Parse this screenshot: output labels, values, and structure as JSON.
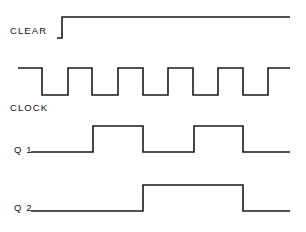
{
  "diagram": {
    "type": "timing-waveform",
    "width": 306,
    "height": 232,
    "background_color": "#ffffff",
    "stroke_color": "#1a1a1a"
  },
  "signals": [
    {
      "key": "clear",
      "label": "CLEAR",
      "label_x": 10,
      "label_y": 31,
      "high_y": 17,
      "low_y": 38,
      "start_x": 57,
      "end_x": 290,
      "description": "Active low then released high",
      "transitions": [
        {
          "x": 62,
          "edge": "rise"
        }
      ],
      "initial_level": "low",
      "path": "M 57 38 L 62 38 L 62 17 L 290 17"
    },
    {
      "key": "clock",
      "label": "CLOCK",
      "label_x": 10,
      "label_y": 108,
      "high_y": 68,
      "low_y": 95,
      "start_x": 18,
      "end_x": 290,
      "description": "Free running square wave, period 50 px",
      "initial_level": "high",
      "transitions": [
        {
          "x": 42,
          "edge": "fall"
        },
        {
          "x": 68,
          "edge": "rise"
        },
        {
          "x": 92,
          "edge": "fall"
        },
        {
          "x": 118,
          "edge": "rise"
        },
        {
          "x": 143,
          "edge": "fall"
        },
        {
          "x": 168,
          "edge": "rise"
        },
        {
          "x": 193,
          "edge": "fall"
        },
        {
          "x": 218,
          "edge": "rise"
        },
        {
          "x": 243,
          "edge": "fall"
        },
        {
          "x": 268,
          "edge": "rise"
        }
      ],
      "path": "M 18 68 L 42 68 L 42 95 L 68 95 L 68 68 L 92 68 L 92 95 L 118 95 L 118 68 L 143 68 L 143 95 L 168 95 L 168 68 L 193 68 L 193 95 L 218 95 L 218 68 L 243 68 L 243 95 L 268 95 L 268 68 L 290 68"
    },
    {
      "key": "q1",
      "label": "Q 1",
      "label_x": 14,
      "label_y": 150,
      "high_y": 126,
      "low_y": 152,
      "start_x": 31,
      "end_x": 290,
      "description": "Divide by two output, two pulses shown",
      "initial_level": "low",
      "transitions": [
        {
          "x": 93,
          "edge": "rise"
        },
        {
          "x": 143,
          "edge": "fall"
        },
        {
          "x": 194,
          "edge": "rise"
        },
        {
          "x": 243,
          "edge": "fall"
        }
      ],
      "path": "M 31 152 L 93 152 L 93 126 L 143 126 L 143 152 L 194 152 L 194 126 L 243 126 L 243 152 L 290 152"
    },
    {
      "key": "q2",
      "label": "Q 2",
      "label_x": 14,
      "label_y": 208,
      "high_y": 185,
      "low_y": 211,
      "start_x": 31,
      "end_x": 290,
      "description": "Divide by four output, one pulse shown",
      "initial_level": "low",
      "transitions": [
        {
          "x": 143,
          "edge": "rise"
        },
        {
          "x": 243,
          "edge": "fall"
        }
      ],
      "path": "M 31 211 L 143 211 L 143 185 L 243 185 L 243 211 L 290 211"
    }
  ]
}
